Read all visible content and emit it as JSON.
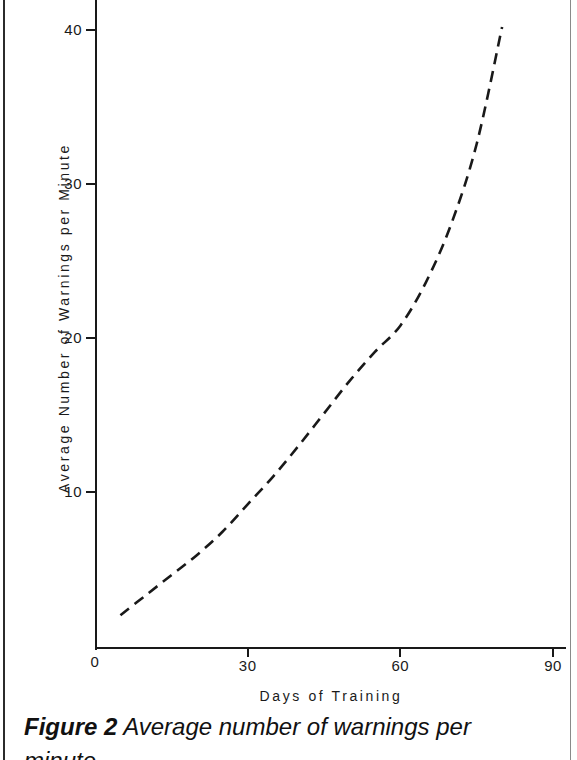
{
  "figure": {
    "caption_label": "Figure 2",
    "caption_text": "Average number of warnings per",
    "caption_line2": "minute."
  },
  "chart_data": {
    "type": "line",
    "title": "",
    "subtitle": "",
    "xlabel": "Days  of  Training",
    "ylabel": "Average  Number  of  Warnings  per  Minute",
    "xlim": [
      0,
      92.5
    ],
    "ylim": [
      0,
      42
    ],
    "grid": false,
    "legend": null,
    "line_style": "dashed",
    "line_color": "#191919",
    "xticks": [
      0,
      30,
      60,
      90
    ],
    "xtick_labels": [
      "0",
      "30",
      "60",
      "90"
    ],
    "yticks": [
      10,
      20,
      30,
      40
    ],
    "ytick_labels": [
      "10",
      "20",
      "30",
      "40"
    ],
    "series": [
      {
        "name": "Average warnings per minute",
        "x": [
          5,
          10,
          15,
          20,
          25,
          30,
          35,
          40,
          45,
          50,
          55,
          60,
          65,
          70,
          75,
          80
        ],
        "y": [
          2.0,
          3.3,
          4.6,
          5.9,
          7.4,
          9.2,
          11.0,
          13.0,
          15.1,
          17.2,
          19.1,
          20.8,
          23.6,
          27.4,
          32.6,
          40.2
        ]
      }
    ]
  }
}
